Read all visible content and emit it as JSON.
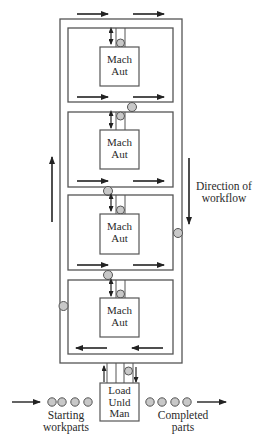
{
  "diagram": {
    "colors": {
      "line": "#555555",
      "arrow": "#222222",
      "part_fill": "#c8c8c8",
      "part_stroke": "#555555",
      "background": "#ffffff"
    },
    "stations": [
      {
        "line1": "Mach",
        "line2": "Aut"
      },
      {
        "line1": "Mach",
        "line2": "Aut"
      },
      {
        "line1": "Mach",
        "line2": "Aut"
      },
      {
        "line1": "Mach",
        "line2": "Aut"
      }
    ],
    "load_station": {
      "line1": "Load",
      "line2": "Unld",
      "line3": "Man"
    },
    "direction_label": {
      "line1": "Direction of",
      "line2": "workflow"
    },
    "input_label": {
      "line1": "Starting",
      "line2": "workparts"
    },
    "output_label": {
      "line1": "Completed",
      "line2": "parts"
    },
    "starting_parts_count": 4,
    "completed_parts_count": 4
  }
}
